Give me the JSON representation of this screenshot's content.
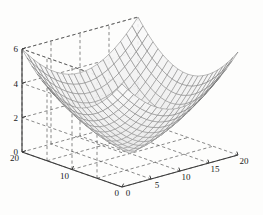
{
  "figure": {
    "kind": "matlab-3d-mesh-surface",
    "background_color": "#fdfdfc",
    "axis_color": "#3a3a3a",
    "grid_color": "#555555",
    "mesh_color": "#6b6b6b",
    "surface_face_color": "#f2f2f2"
  },
  "chart_data": {
    "type": "surface",
    "title": "",
    "xlabel": "",
    "ylabel": "",
    "zlabel": "",
    "grid": true,
    "legend": null,
    "view": {
      "azimuth": -37.5,
      "elevation": 30
    },
    "xlim": [
      0,
      20
    ],
    "ylim": [
      0,
      20
    ],
    "zlim": [
      0,
      6
    ],
    "x_ticks": [
      0,
      5,
      10,
      15,
      20
    ],
    "x_tick_labels": [
      "0",
      "5",
      "10",
      "15",
      "20"
    ],
    "y_ticks": [
      0,
      10,
      20
    ],
    "y_tick_labels": [
      "0",
      "10",
      "20"
    ],
    "z_ticks": [
      0,
      2,
      4,
      6
    ],
    "z_tick_labels": [
      "0",
      "2",
      "4",
      "6"
    ],
    "mesh_nx": 21,
    "mesh_ny": 21,
    "surface_function": "z = sqrt(((x-10)/10)^2 + ((y-10)/10)^2) * 6",
    "z_min": 0,
    "z_max": 6,
    "corner_values": [
      {
        "x": 0,
        "y": 0,
        "z": 6.0
      },
      {
        "x": 20,
        "y": 0,
        "z": 6.0
      },
      {
        "x": 0,
        "y": 20,
        "z": 6.0
      },
      {
        "x": 20,
        "y": 20,
        "z": 6.0
      },
      {
        "x": 10,
        "y": 10,
        "z": 0.0
      }
    ]
  },
  "axes": {
    "x_axis": {
      "name": "x-axis",
      "ticks": [
        "0",
        "5",
        "10",
        "15",
        "20"
      ]
    },
    "y_axis": {
      "name": "y-axis",
      "ticks": [
        "0",
        "10",
        "20"
      ]
    },
    "z_axis": {
      "name": "z-axis",
      "ticks": [
        "0",
        "2",
        "4",
        "6"
      ]
    }
  },
  "labels": {
    "z6": "6",
    "z4": "4",
    "z2": "2",
    "z0": "0",
    "y20": "20",
    "y10": "10",
    "y0": "0",
    "x0": "0",
    "x5": "5",
    "x10": "10",
    "x15": "15",
    "x20": "20"
  }
}
